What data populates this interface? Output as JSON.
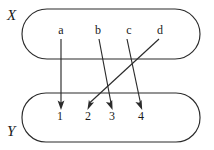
{
  "diagram": {
    "type": "set-mapping",
    "stroke_color": "#2b2b2b",
    "text_color": "#1a1a1a",
    "background_color": "#ffffff",
    "domain_set": {
      "name": "X",
      "label": "X",
      "elements": [
        {
          "id": "a",
          "label": "a",
          "x": 61,
          "y": 34
        },
        {
          "id": "b",
          "label": "b",
          "x": 98,
          "y": 34
        },
        {
          "id": "c",
          "label": "c",
          "x": 129,
          "y": 34
        },
        {
          "id": "d",
          "label": "d",
          "x": 160,
          "y": 34
        }
      ],
      "box": {
        "x": 22,
        "y": 9,
        "width": 178,
        "height": 50,
        "radius": 25
      },
      "label_pos": {
        "x": 7,
        "y": 20
      }
    },
    "codomain_set": {
      "name": "Y",
      "label": "Y",
      "elements": [
        {
          "id": "1",
          "label": "1",
          "x": 60,
          "y": 120
        },
        {
          "id": "2",
          "label": "2",
          "x": 88,
          "y": 120
        },
        {
          "id": "3",
          "label": "3",
          "x": 112,
          "y": 120
        },
        {
          "id": "4",
          "label": "4",
          "x": 141,
          "y": 120
        }
      ],
      "box": {
        "x": 22,
        "y": 93,
        "width": 178,
        "height": 49,
        "radius": 24
      },
      "label_pos": {
        "x": 7,
        "y": 136
      }
    },
    "mappings": [
      {
        "from": "a",
        "to": "1",
        "x1": 61,
        "y1": 39,
        "x2": 61,
        "y2": 108
      },
      {
        "from": "b",
        "to": "3",
        "x1": 99,
        "y1": 39,
        "x2": 112,
        "y2": 108
      },
      {
        "from": "c",
        "to": "4",
        "x1": 127,
        "y1": 39,
        "x2": 142,
        "y2": 108
      },
      {
        "from": "d",
        "to": "2",
        "x1": 159,
        "y1": 39,
        "x2": 88,
        "y2": 108
      }
    ]
  }
}
